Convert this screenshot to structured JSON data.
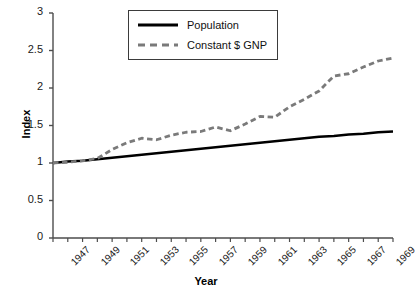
{
  "chart_data": {
    "type": "line",
    "title": "",
    "xlabel": "Year",
    "ylabel": "Index",
    "xlim": [
      1947,
      1970
    ],
    "ylim": [
      0,
      3
    ],
    "yticks": [
      "0",
      "0.5",
      "1",
      "1.5",
      "2",
      "2.5",
      "3"
    ],
    "ytick_values": [
      0,
      0.5,
      1,
      1.5,
      2,
      2.5,
      3
    ],
    "xticks": [
      "1947",
      "1949",
      "1951",
      "1953",
      "1955",
      "1957",
      "1959",
      "1961",
      "1963",
      "1965",
      "1967",
      "1969"
    ],
    "xtick_values": [
      1947,
      1949,
      1951,
      1953,
      1955,
      1957,
      1959,
      1961,
      1963,
      1965,
      1967,
      1969
    ],
    "grid": false,
    "legend_position": "top-center",
    "x": [
      1947,
      1948,
      1949,
      1950,
      1951,
      1952,
      1953,
      1954,
      1955,
      1956,
      1957,
      1958,
      1959,
      1960,
      1961,
      1962,
      1963,
      1964,
      1965,
      1966,
      1967,
      1968,
      1969,
      1970
    ],
    "series": [
      {
        "name": "Population",
        "style": "solid",
        "color": "#000000",
        "values": [
          1.0,
          1.02,
          1.03,
          1.05,
          1.07,
          1.09,
          1.11,
          1.13,
          1.15,
          1.17,
          1.19,
          1.21,
          1.23,
          1.25,
          1.27,
          1.29,
          1.31,
          1.33,
          1.35,
          1.36,
          1.38,
          1.39,
          1.41,
          1.42
        ]
      },
      {
        "name": "Constant $ GNP",
        "style": "dashed",
        "color": "#7a7a7a",
        "values": [
          1.0,
          1.01,
          1.03,
          1.06,
          1.18,
          1.27,
          1.33,
          1.31,
          1.37,
          1.41,
          1.42,
          1.48,
          1.43,
          1.52,
          1.62,
          1.61,
          1.75,
          1.85,
          1.96,
          2.16,
          2.19,
          2.28,
          2.36,
          2.4
        ]
      }
    ]
  },
  "legend": {
    "items": [
      {
        "label": "Population"
      },
      {
        "label": "Constant $ GNP"
      }
    ]
  },
  "axes": {
    "y_title": "Index",
    "x_title": "Year"
  }
}
